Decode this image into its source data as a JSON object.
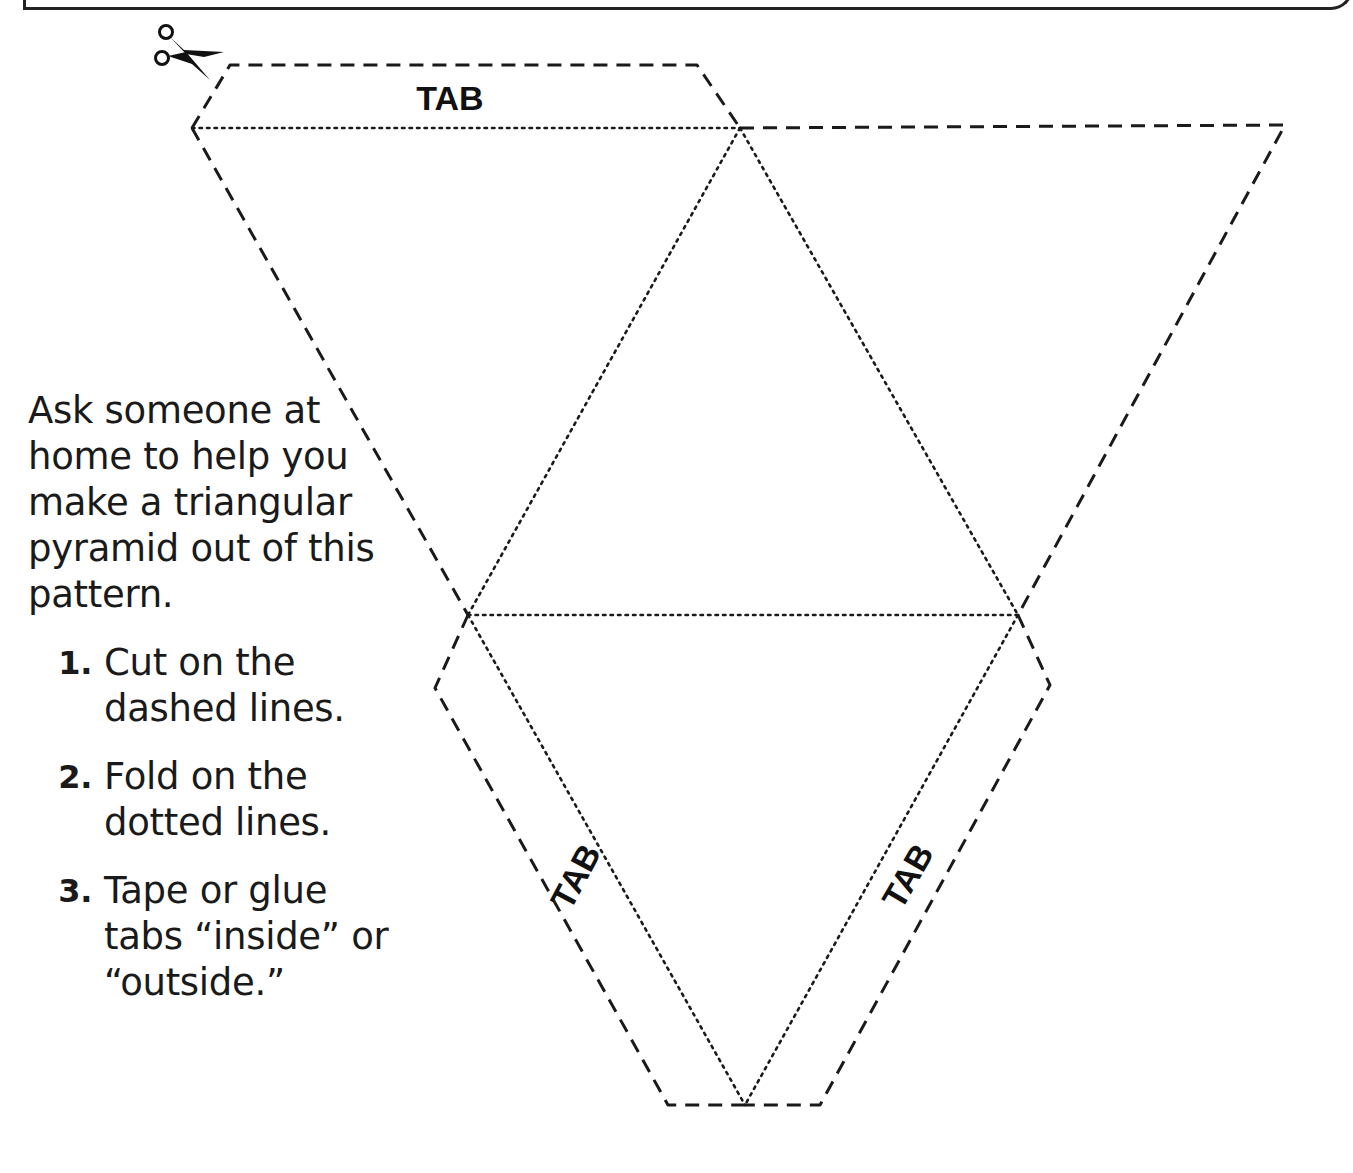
{
  "intro_text": "Ask someone at home to help you make a triangular pyramid out of this pattern.",
  "steps": [
    {
      "number": "1.",
      "text": "Cut on the dashed lines."
    },
    {
      "number": "2.",
      "text": "Fold on the dotted lines."
    },
    {
      "number": "3.",
      "text": "Tape or glue tabs “inside” or “outside.”"
    }
  ],
  "tabs": {
    "top": "TAB",
    "left": "TAB",
    "right": "TAB"
  },
  "icons": {
    "cut_marker": "scissors-icon"
  },
  "colors": {
    "ink": "#1a1a1a",
    "background": "#ffffff"
  }
}
